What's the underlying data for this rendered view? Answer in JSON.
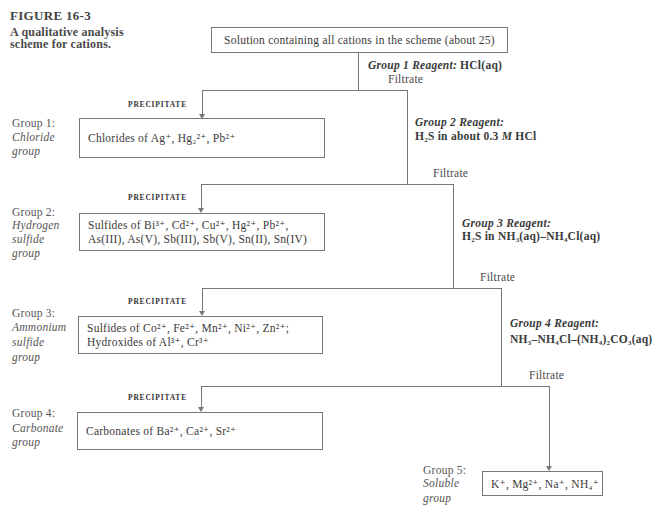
{
  "figure": {
    "number": "FIGURE 16-3",
    "caption_lines": [
      "A qualitative analysis",
      "scheme for cations."
    ]
  },
  "start_box": "Solution containing all cations in the scheme (about 25)",
  "precipitate_label": "PRECIPITATE",
  "filtrate_label": "Filtrate",
  "groups": [
    {
      "label": "Group 1:",
      "name_lines": [
        "Chloride",
        "group"
      ],
      "box_lines": [
        "Chlorides of Ag⁺, Hg₂²⁺, Pb²⁺"
      ],
      "reagent": {
        "title": "Group 1 Reagent:",
        "formula": [
          {
            "text": "HCl(aq)",
            "italic": false
          }
        ]
      }
    },
    {
      "label": "Group 2:",
      "name_lines": [
        "Hydrogen",
        "sulfide",
        "group"
      ],
      "box_lines": [
        "Sulfides of Bi³⁺, Cd²⁺, Cu²⁺, Hg²⁺, Pb²⁺,",
        "As(III), As(V), Sb(III), Sb(V), Sn(II), Sn(IV)"
      ],
      "reagent": {
        "title": "Group 2 Reagent:",
        "formula": [
          {
            "text": "H₂S in about 0.3 ",
            "italic": false
          },
          {
            "text": "M",
            "italic": true
          },
          {
            "text": " HCl",
            "italic": false
          }
        ]
      }
    },
    {
      "label": "Group 3:",
      "name_lines": [
        "Ammonium",
        "sulfide",
        "group"
      ],
      "box_lines": [
        "Sulfides of Co²⁺, Fe²⁺, Mn²⁺, Ni²⁺, Zn²⁺;",
        "Hydroxides of Al³⁺, Cr³⁺"
      ],
      "reagent": {
        "title": "Group 3 Reagent:",
        "formula": [
          {
            "text": "H₂S in NH₃(aq)–NH₄Cl(aq)",
            "italic": false
          }
        ]
      }
    },
    {
      "label": "Group 4:",
      "name_lines": [
        "Carbonate",
        "group"
      ],
      "box_lines": [
        "Carbonates of Ba²⁺, Ca²⁺, Sr²⁺"
      ],
      "reagent": {
        "title": "Group 4 Reagent:",
        "formula": [
          {
            "text": "NH₃–NH₄Cl–(NH₄)₂CO₃(aq)",
            "italic": false
          }
        ]
      }
    },
    {
      "label": "Group 5:",
      "name_lines": [
        "Soluble",
        "group"
      ],
      "box_lines": [
        "K⁺, Mg²⁺, Na⁺, NH₄⁺"
      ]
    }
  ],
  "colors": {
    "line": "#777777",
    "text": "#3a3a3a",
    "background": "#ffffff"
  }
}
